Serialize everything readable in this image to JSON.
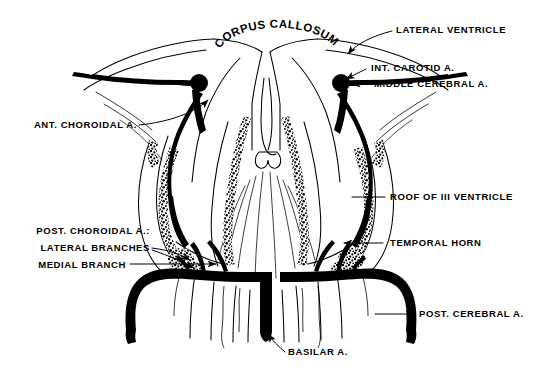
{
  "figure": {
    "kind": "anatomical-line-drawing",
    "background_color": "#ffffff",
    "ink_color": "#000000"
  },
  "title_arc": {
    "text": "CORPUS CALLOSUM",
    "letters": [
      "C",
      "O",
      "R",
      "P",
      "U",
      "S",
      " ",
      "C",
      "A",
      "L",
      "L",
      "O",
      "S",
      "U",
      "M"
    ]
  },
  "labels": {
    "lateral_ventricle": "LATERAL VENTRICLE",
    "int_carotid": "INT. CAROTID A.",
    "middle_cerebral": "MIDDLE CEREBRAL A.",
    "ant_choroidal": "ANT. CHOROIDAL A.",
    "roof_third_ventricle_pre": "ROOF OF ",
    "roof_third_ventricle_num": "III",
    "roof_third_ventricle_post": " VENTRICLE",
    "temporal_horn": "TEMPORAL HORN",
    "post_choroidal": "POST. CHOROIDAL A.:",
    "lateral_branches": "LATERAL BRANCHES",
    "medial_branch": "MEDIAL BRANCH",
    "post_cerebral": "POST. CEREBRAL A.",
    "basilar": "BASILAR A."
  }
}
